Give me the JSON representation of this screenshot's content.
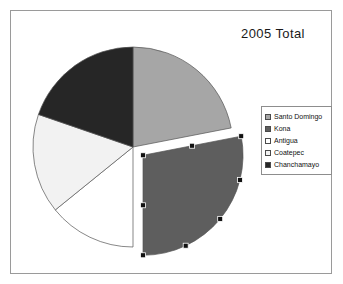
{
  "figure": {
    "title": "2005 Total",
    "border_color": "#9a9a9a",
    "background": "#ffffff"
  },
  "legend": {
    "position": "right",
    "items": [
      {
        "label": "Santo Domingo",
        "color": "#a6a6a6"
      },
      {
        "label": "Kona",
        "color": "#5e5e5e"
      },
      {
        "label": "Antigua",
        "color": "#ffffff"
      },
      {
        "label": "Coatepec",
        "color": "#f2f2f2"
      },
      {
        "label": "Chanchamayo",
        "color": "#262626"
      }
    ]
  },
  "chart_data": {
    "type": "pie",
    "title": "2005 Total",
    "xlabel": "",
    "ylabel": "",
    "legend_position": "right",
    "start_angle_deg": 0,
    "direction": "clockwise",
    "categories": [
      "Santo Domingo",
      "Kona",
      "Antigua",
      "Coatepec",
      "Chanchamayo"
    ],
    "values": [
      22,
      28,
      14,
      16,
      20
    ],
    "percent": [
      22,
      28,
      14,
      16,
      20
    ],
    "colors": [
      "#a6a6a6",
      "#5e5e5e",
      "#ffffff",
      "#f2f2f2",
      "#262626"
    ],
    "exploded": [
      "Kona"
    ],
    "selected_slice": "Kona",
    "slice_angles_deg": [
      {
        "name": "Santo Domingo",
        "start": 0,
        "end": 79
      },
      {
        "name": "Kona",
        "start": 79,
        "end": 180
      },
      {
        "name": "Antigua",
        "start": 180,
        "end": 231
      },
      {
        "name": "Coatepec",
        "start": 231,
        "end": 289
      },
      {
        "name": "Chanchamayo",
        "start": 289,
        "end": 360
      }
    ]
  },
  "caption_fragment": ""
}
